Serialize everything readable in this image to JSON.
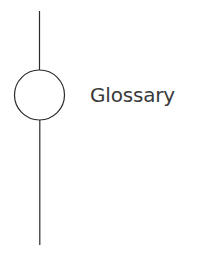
{
  "node": {
    "label": "Glossary",
    "color": "#3a3a3a"
  },
  "line": {
    "color": "#2a2a2a"
  }
}
